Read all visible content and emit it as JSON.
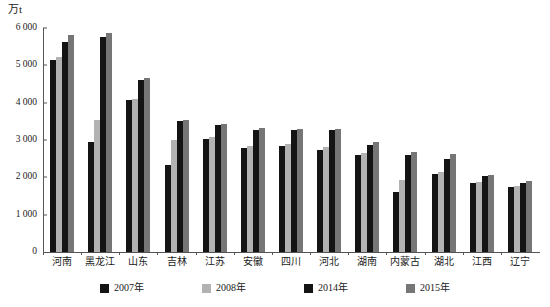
{
  "chart_data": {
    "type": "bar",
    "title": "",
    "xlabel": "",
    "ylabel": "万t",
    "ylim": [
      0,
      6000
    ],
    "ytick_labels": [
      "0",
      "1 000",
      "2 000",
      "3 000",
      "4 000",
      "5 000",
      "6 000"
    ],
    "ytick_values": [
      0,
      1000,
      2000,
      3000,
      4000,
      5000,
      6000
    ],
    "grid": false,
    "legend_position": "bottom",
    "categories": [
      "河南",
      "黑龙江",
      "山东",
      "吉林",
      "江苏",
      "安徽",
      "四川",
      "河北",
      "湖南",
      "内蒙古",
      "湖北",
      "江西",
      "辽宁"
    ],
    "series": [
      {
        "name": "2007年",
        "color": "#141414",
        "values": [
          5130,
          2960,
          4060,
          2340,
          3020,
          2790,
          2850,
          2740,
          2610,
          1610,
          2100,
          1840,
          1740
        ]
      },
      {
        "name": "2008年",
        "color": "#b2b2b2",
        "values": [
          5220,
          3530,
          4110,
          3000,
          3070,
          2840,
          2890,
          2800,
          2650,
          1940,
          2150,
          1880,
          1760
        ]
      },
      {
        "name": "2014年",
        "color": "#141414",
        "values": [
          5620,
          5770,
          4600,
          3500,
          3390,
          3260,
          3260,
          3270,
          2870,
          2590,
          2490,
          2030,
          1840
        ]
      },
      {
        "name": "2015年",
        "color": "#767676",
        "values": [
          5810,
          5870,
          4650,
          3540,
          3440,
          3330,
          3300,
          3300,
          2940,
          2680,
          2620,
          2060,
          1890
        ]
      }
    ]
  }
}
